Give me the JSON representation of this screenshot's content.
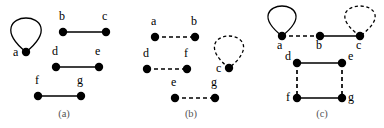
{
  "figure": {
    "width": 384,
    "height": 128,
    "background_color": "#ffffff",
    "edge_color": "#000000",
    "vertex_color": "#000000",
    "caption_color": "#555555",
    "vertex_radius": 4.2
  },
  "panels": [
    {
      "id": "panel-a",
      "caption": "(a)",
      "caption_x": 64,
      "caption_y": 117,
      "vertices": [
        {
          "id": "a",
          "label": "a",
          "x": 26,
          "y": 52,
          "label_x": 13,
          "label_y": 56
        },
        {
          "id": "b",
          "label": "b",
          "x": 63,
          "y": 32,
          "label_x": 59,
          "label_y": 20
        },
        {
          "id": "c",
          "label": "c",
          "x": 106,
          "y": 32,
          "label_x": 102,
          "label_y": 20
        },
        {
          "id": "d",
          "label": "d",
          "x": 56,
          "y": 67,
          "label_x": 52,
          "label_y": 55
        },
        {
          "id": "e",
          "label": "e",
          "x": 99,
          "y": 67,
          "label_x": 95,
          "label_y": 55
        },
        {
          "id": "f",
          "label": "f",
          "x": 38,
          "y": 96,
          "label_x": 35,
          "label_y": 84
        },
        {
          "id": "g",
          "label": "g",
          "x": 81,
          "y": 96,
          "label_x": 77,
          "label_y": 84
        }
      ],
      "edges": [
        {
          "from": "b",
          "to": "c",
          "style": "solid"
        },
        {
          "from": "d",
          "to": "e",
          "style": "solid"
        },
        {
          "from": "f",
          "to": "g",
          "style": "solid"
        }
      ],
      "loops": [
        {
          "at": "a",
          "style": "solid",
          "direction": "up",
          "height": 34,
          "width": 26
        }
      ]
    },
    {
      "id": "panel-b",
      "caption": "(b)",
      "caption_x": 191,
      "caption_y": 117,
      "vertices": [
        {
          "id": "a",
          "label": "a",
          "x": 155,
          "y": 37,
          "label_x": 151,
          "label_y": 25
        },
        {
          "id": "b",
          "label": "b",
          "x": 195,
          "y": 37,
          "label_x": 191,
          "label_y": 25
        },
        {
          "id": "d",
          "label": "d",
          "x": 147,
          "y": 69,
          "label_x": 143,
          "label_y": 57
        },
        {
          "id": "f",
          "label": "f",
          "x": 187,
          "y": 69,
          "label_x": 184,
          "label_y": 57
        },
        {
          "id": "e",
          "label": "e",
          "x": 175,
          "y": 98,
          "label_x": 171,
          "label_y": 86
        },
        {
          "id": "g",
          "label": "g",
          "x": 215,
          "y": 98,
          "label_x": 211,
          "label_y": 86
        },
        {
          "id": "c",
          "label": "c",
          "x": 229,
          "y": 68,
          "label_x": 216,
          "label_y": 72
        }
      ],
      "edges": [
        {
          "from": "a",
          "to": "b",
          "style": "dashed"
        },
        {
          "from": "d",
          "to": "f",
          "style": "dashed"
        },
        {
          "from": "e",
          "to": "g",
          "style": "dashed"
        }
      ],
      "loops": [
        {
          "at": "c",
          "style": "dashed",
          "direction": "up",
          "height": 32,
          "width": 25
        }
      ]
    },
    {
      "id": "panel-c",
      "caption": "(c)",
      "caption_x": 322,
      "caption_y": 117,
      "vertices": [
        {
          "id": "a",
          "label": "a",
          "x": 282,
          "y": 36,
          "label_x": 277,
          "label_y": 49
        },
        {
          "id": "b",
          "label": "b",
          "x": 320,
          "y": 36,
          "label_x": 316,
          "label_y": 49
        },
        {
          "id": "c",
          "label": "c",
          "x": 360,
          "y": 36,
          "label_x": 356,
          "label_y": 49
        },
        {
          "id": "d",
          "label": "d",
          "x": 297,
          "y": 63,
          "label_x": 285,
          "label_y": 60
        },
        {
          "id": "e",
          "label": "e",
          "x": 342,
          "y": 63,
          "label_x": 348,
          "label_y": 60
        },
        {
          "id": "f",
          "label": "f",
          "x": 297,
          "y": 98,
          "label_x": 286,
          "label_y": 101
        },
        {
          "id": "g",
          "label": "g",
          "x": 342,
          "y": 98,
          "label_x": 348,
          "label_y": 101
        }
      ],
      "edges": [
        {
          "from": "a",
          "to": "b",
          "style": "dashed"
        },
        {
          "from": "b",
          "to": "c",
          "style": "solid"
        },
        {
          "from": "d",
          "to": "e",
          "style": "solid"
        },
        {
          "from": "f",
          "to": "g",
          "style": "solid"
        },
        {
          "from": "d",
          "to": "f",
          "style": "dashed"
        },
        {
          "from": "e",
          "to": "g",
          "style": "dashed"
        }
      ],
      "loops": [
        {
          "at": "a",
          "style": "solid",
          "direction": "up",
          "height": 30,
          "width": 24
        },
        {
          "at": "c",
          "style": "dashed",
          "direction": "up",
          "height": 30,
          "width": 26
        }
      ]
    }
  ]
}
